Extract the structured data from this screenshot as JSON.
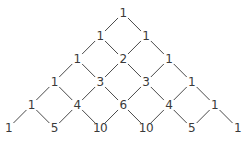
{
  "diagram": {
    "title": "",
    "type": "pascals-triangle",
    "rows": [
      [
        "1"
      ],
      [
        "1",
        "1"
      ],
      [
        "1",
        "2",
        "1"
      ],
      [
        "1",
        "3",
        "3",
        "1"
      ],
      [
        "1",
        "4",
        "6",
        "4",
        "1"
      ],
      [
        "1",
        "5",
        "10",
        "10",
        "5",
        "1"
      ]
    ],
    "colors": {
      "text": "#3a3a3a",
      "line": "#4a4a4a",
      "background": "#ffffff"
    }
  }
}
